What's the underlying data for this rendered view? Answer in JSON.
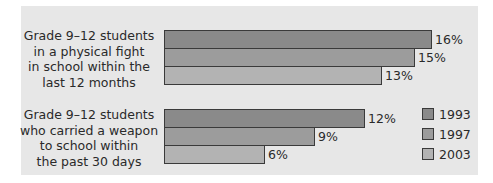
{
  "chart_data": {
    "type": "bar",
    "orientation": "horizontal",
    "categories": [
      "Grade 9–12 students in a physical fight in school within the last 12 months",
      "Grade 9–12 students who carried a weapon to school within the past 30 days"
    ],
    "category_lines": [
      [
        "Grade 9–12 students",
        "in a physical fight",
        "in school within the",
        "last 12 months"
      ],
      [
        "Grade 9–12 students",
        "who carried a weapon",
        "to school within",
        "the past 30 days"
      ]
    ],
    "series": [
      {
        "name": "1993",
        "values": [
          16,
          12
        ],
        "color": "#8a8a8a"
      },
      {
        "name": "1997",
        "values": [
          15,
          9
        ],
        "color": "#9c9c9c"
      },
      {
        "name": "2003",
        "values": [
          13,
          6
        ],
        "color": "#b3b3b3"
      }
    ],
    "value_labels": [
      [
        "16%",
        "12%"
      ],
      [
        "15%",
        "9%"
      ],
      [
        "13%",
        "6%"
      ]
    ],
    "unit": "%",
    "title": "",
    "xlabel": "",
    "ylabel": "",
    "grid": false,
    "legend_position": "right",
    "background": "#e7e7e7"
  }
}
